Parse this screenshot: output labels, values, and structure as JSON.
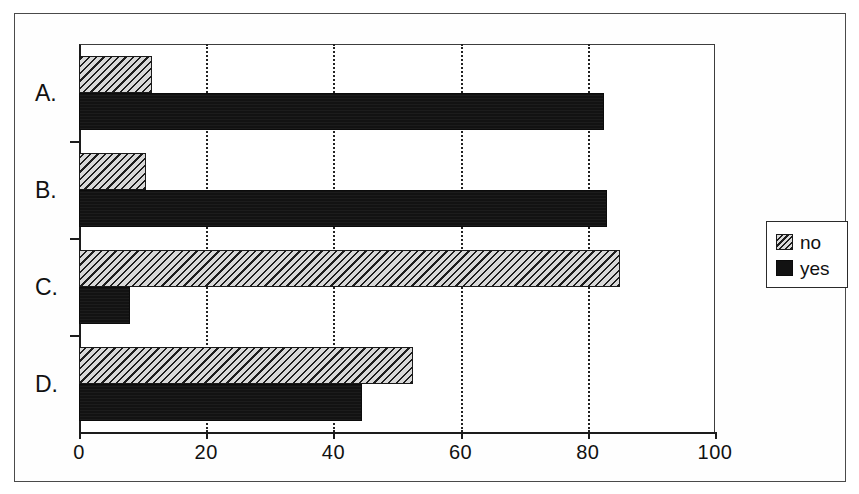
{
  "chart_data": {
    "type": "bar",
    "orientation": "horizontal",
    "title": "",
    "xlabel": "",
    "ylabel": "",
    "categories": [
      "A.",
      "B.",
      "C.",
      "D."
    ],
    "series": [
      {
        "name": "no",
        "values": [
          11.5,
          10.5,
          85.0,
          52.5
        ],
        "pattern": "diagonal-hatch",
        "color": "#d8d8d8"
      },
      {
        "name": "yes",
        "values": [
          82.5,
          83.0,
          8.0,
          44.5
        ],
        "pattern": "solid",
        "color": "#121212"
      }
    ],
    "xlim": [
      0,
      100
    ],
    "xticks": [
      0,
      20,
      40,
      60,
      80,
      100
    ],
    "xtick_labels": [
      "0",
      "20",
      "40",
      "60",
      "80",
      "100"
    ],
    "gridlines": [
      20,
      40,
      60,
      80
    ],
    "grid": "vertical-dotted",
    "legend": {
      "position": "right",
      "entries": [
        {
          "label": "no",
          "swatch": "hatch-swatch"
        },
        {
          "label": "yes",
          "swatch": "solid-swatch"
        }
      ]
    },
    "frame": "outer-rectangle"
  }
}
